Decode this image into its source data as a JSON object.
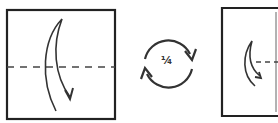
{
  "diagram": {
    "type": "origami-instructions",
    "steps": [
      {
        "id": "step-1",
        "shape": "square",
        "fold_line": "horizontal-valley-dashed",
        "arrow": "fold-top-down"
      },
      {
        "id": "rotate",
        "symbol": "rotate-arrows",
        "label": "¼"
      },
      {
        "id": "step-2",
        "shape": "rectangle-partial",
        "fold_line": "horizontal-valley-dashed-short",
        "arrow": "fold-small-down"
      }
    ],
    "colors": {
      "ink": "#333333",
      "background": "#ffffff"
    }
  }
}
